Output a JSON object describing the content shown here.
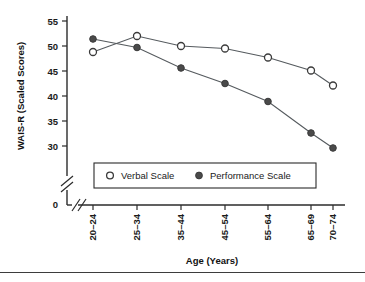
{
  "chart_data": {
    "type": "line",
    "title": "",
    "subtitle": "",
    "xlabel": "Age (Years)",
    "ylabel": "WAIS-R (Scaled Scores)",
    "categories": [
      "20–24",
      "25–34",
      "35–44",
      "45–54",
      "55–64",
      "65–69",
      "70–74"
    ],
    "ylim": [
      28,
      56
    ],
    "yticks": [
      30,
      35,
      40,
      45,
      50,
      55
    ],
    "ytick_labels": [
      "30",
      "35",
      "40",
      "45",
      "50",
      "55"
    ],
    "origin_label": "0",
    "grid": false,
    "axis_break_y": true,
    "axis_break_x": true,
    "legend_position": "lower-center",
    "series": [
      {
        "name": "Verbal Scale",
        "marker": "open-circle",
        "values": [
          48.8,
          52.0,
          50.0,
          49.5,
          47.7,
          45.1,
          42.1
        ]
      },
      {
        "name": "Performance Scale",
        "marker": "filled-circle",
        "values": [
          51.4,
          49.7,
          45.6,
          42.5,
          38.9,
          32.6,
          29.6
        ]
      }
    ]
  },
  "legend": {
    "entries": [
      {
        "label": "Verbal Scale",
        "marker": "open-circle"
      },
      {
        "label": "Performance Scale",
        "marker": "filled-circle"
      }
    ]
  },
  "colors": {
    "axis": "#2b2b2b",
    "line": "#555a5e",
    "marker_fill_open": "#ffffff",
    "marker_fill_closed": "#4a4a4a",
    "text": "#1a1a1a",
    "background": "#ffffff"
  }
}
